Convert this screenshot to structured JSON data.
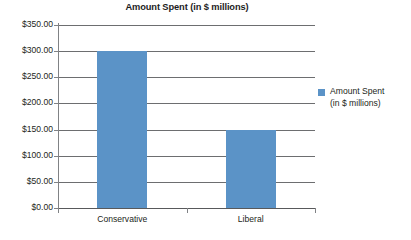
{
  "chart_data": {
    "type": "bar",
    "title": "Amount Spent (in $ millions)",
    "categories": [
      "Conservative",
      "Liberal"
    ],
    "values": [
      300.0,
      150.0
    ],
    "series": [
      {
        "name": "Amount Spent (in $ millions)",
        "values": [
          300.0,
          150.0
        ]
      }
    ],
    "xlabel": "",
    "ylabel": "",
    "ylim": [
      0,
      350
    ],
    "ytick_step": 50,
    "ytick_labels": [
      "$350.00",
      "$300.00",
      "$250.00",
      "$200.00",
      "$150.00",
      "$100.00",
      "$50.00",
      "$0.00"
    ],
    "ytick_values": [
      350,
      300,
      250,
      200,
      150,
      100,
      50,
      0
    ],
    "grid": true,
    "legend_position": "right",
    "legend": {
      "entries": [
        {
          "label_line1": "Amount Spent",
          "label_line2": "(in $ millions)",
          "color": "#5b93c7"
        }
      ]
    },
    "colors": {
      "bar": "#5b93c7",
      "gridline": "#6d6e70",
      "axis": "#808285",
      "text": "#231f20",
      "background": "#ffffff"
    }
  }
}
